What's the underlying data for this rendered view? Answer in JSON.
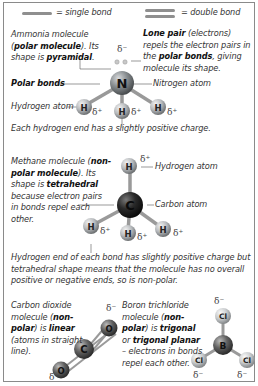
{
  "legend": {
    "single_bond": "= single bond",
    "double_bond": "= double bond"
  },
  "ammonia": {
    "desc_parts": [
      "Ammonia molecule (",
      "polar molecule",
      "). Its shape is ",
      "pyramidal",
      "."
    ],
    "lone_pair_parts": [
      "Lone pair",
      " (electrons) repels the electron pairs in the ",
      "polar bonds",
      ", giving molecule its shape."
    ],
    "polar_bonds_label": "Polar bonds",
    "nitrogen_label": "Nitrogen atom",
    "hydrogen_label": "Hydrogen atom",
    "caption": "Each hydrogen end has a slightly positive charge.",
    "central_atom": "N",
    "outer_atom": "H",
    "lone_pair_charge": "δ⁻",
    "h_charge": "δ⁺"
  },
  "methane": {
    "desc_parts": [
      "Methane molecule (",
      "non-polar molecule",
      "). Its shape is ",
      "tetrahedral",
      " because electron pairs in bonds repel each other."
    ],
    "hydrogen_label": "Hydrogen atom",
    "carbon_label": "Carbon atom",
    "central_atom": "C",
    "outer_atom": "H",
    "h_charge": "δ⁺",
    "caption": "Hydrogen end of each bond has slightly positive charge but tetrahedral shape means that the molecule has no overall positive or negative ends, so is non-polar."
  },
  "co2": {
    "desc_parts": [
      "Carbon dioxide molecule (",
      "non-polar",
      ") is ",
      "linear",
      " (atoms in straight line)."
    ],
    "central_atom": "C",
    "outer_atom": "O",
    "o_charge": "δ⁻"
  },
  "bcl3": {
    "desc_parts": [
      "Boron trichloride molecule (",
      "non-polar",
      ") is ",
      "trigonal",
      " or ",
      "trigonal planar",
      " – electrons in bonds repel each other."
    ],
    "central_atom": "B",
    "outer_atom": "Cl",
    "cl_charge": "δ⁻"
  },
  "colors": {
    "frame": "#8a8a8a",
    "nitrogen": "#7d8285",
    "hydrogen": "#b8bcbf",
    "carbon": "#1e1e1e",
    "oxygen": "#555555",
    "boron": "#6a6a6a",
    "chlorine": "#c7cbce",
    "bond": "#9a9a9a"
  }
}
